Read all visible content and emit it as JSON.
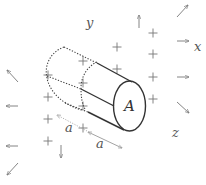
{
  "diagram": {
    "axis_labels": {
      "x": "x",
      "y": "y",
      "z": "z"
    },
    "surface_label": "A",
    "length_labels": [
      "a",
      "a"
    ],
    "charge_symbol": "+",
    "plus_positions": [
      [
        153,
        33
      ],
      [
        117,
        47
      ],
      [
        153,
        54
      ],
      [
        83,
        61
      ],
      [
        117,
        69
      ],
      [
        153,
        77
      ],
      [
        48,
        75
      ],
      [
        83,
        83
      ],
      [
        153,
        99
      ],
      [
        48,
        97
      ],
      [
        83,
        106
      ],
      [
        48,
        119
      ],
      [
        83,
        128
      ],
      [
        48,
        141
      ]
    ],
    "field_arrows": [
      {
        "name": "up",
        "from": [
          139,
          28
        ],
        "to": [
          139,
          15
        ]
      },
      {
        "name": "north-east",
        "from": [
          177,
          17
        ],
        "to": [
          188,
          5
        ]
      },
      {
        "name": "right-upper",
        "from": [
          177,
          41
        ],
        "to": [
          189,
          41
        ]
      },
      {
        "name": "right-lower",
        "from": [
          177,
          77
        ],
        "to": [
          189,
          77
        ]
      },
      {
        "name": "south-east",
        "from": [
          177,
          102
        ],
        "to": [
          189,
          113
        ]
      },
      {
        "name": "north-west",
        "from": [
          18,
          82
        ],
        "to": [
          7,
          70
        ]
      },
      {
        "name": "left-upper",
        "from": [
          18,
          106
        ],
        "to": [
          6,
          106
        ]
      },
      {
        "name": "left-lower",
        "from": [
          18,
          146
        ],
        "to": [
          6,
          146
        ]
      },
      {
        "name": "south-west",
        "from": [
          18,
          163
        ],
        "to": [
          7,
          175
        ]
      },
      {
        "name": "down",
        "from": [
          61,
          145
        ],
        "to": [
          61,
          158
        ]
      }
    ]
  }
}
